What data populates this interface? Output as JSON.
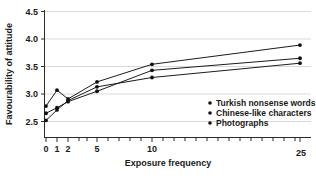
{
  "chart_data": {
    "type": "line",
    "title": "",
    "xlabel": "Exposure frequency",
    "ylabel": "Favourability of attitude",
    "x": [
      0,
      1,
      2,
      5,
      10,
      25
    ],
    "xtick_labels": [
      "0",
      "1",
      "2",
      "5",
      "10",
      "25"
    ],
    "ytick_labels": [
      "2.5",
      "3.0",
      "3.5",
      "4.0",
      "4.5"
    ],
    "ylim": [
      2.35,
      4.5
    ],
    "grid": "horizontal",
    "legend_position": "inside-right-lower",
    "series": [
      {
        "name": "Turkish nonsense words",
        "values": [
          2.78,
          3.07,
          2.91,
          3.22,
          3.54,
          3.89
        ]
      },
      {
        "name": "Chinese-like characters",
        "values": [
          2.65,
          2.75,
          2.86,
          3.05,
          3.43,
          3.65
        ]
      },
      {
        "name": "Photographs",
        "values": [
          2.52,
          2.71,
          2.88,
          3.13,
          3.3,
          3.56
        ]
      }
    ]
  },
  "axes": {
    "y_title": "Favourability of attitude",
    "x_title": "Exposure frequency",
    "y_ticks": [
      {
        "label": "4.5"
      },
      {
        "label": "4.0"
      },
      {
        "label": "3.5"
      },
      {
        "label": "3.0"
      },
      {
        "label": "2.5"
      }
    ],
    "x_ticks": [
      {
        "label": "0"
      },
      {
        "label": "1"
      },
      {
        "label": "2"
      },
      {
        "label": "5"
      },
      {
        "label": "10"
      },
      {
        "label": "25"
      }
    ]
  },
  "legend": {
    "items": [
      {
        "label": "Turkish nonsense words"
      },
      {
        "label": "Chinese-like characters"
      },
      {
        "label": "Photographs"
      }
    ]
  },
  "colors": {
    "line": "#1c1c1c",
    "marker": "#111111",
    "grid": "#c9c9c9",
    "axis": "#2b2b2b",
    "text": "#1a1a1a",
    "background": "#ffffff"
  }
}
